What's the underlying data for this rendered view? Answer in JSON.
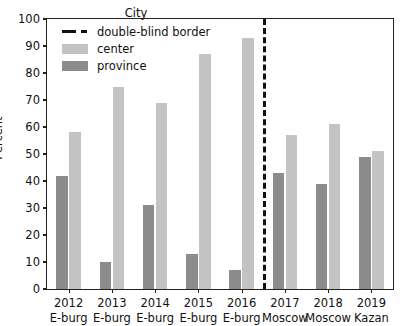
{
  "chart_data": {
    "type": "bar",
    "title": "",
    "xlabel": "",
    "ylabel": "Percent",
    "ylim": [
      0,
      100
    ],
    "yticks": [
      0,
      10,
      20,
      30,
      40,
      50,
      60,
      70,
      80,
      90,
      100
    ],
    "grid": false,
    "legend": {
      "title": "City",
      "position": "upper-center",
      "entries": [
        {
          "label": "double-blind border",
          "style": "dashed-line",
          "color": "#111111"
        },
        {
          "label": "center",
          "style": "bar",
          "color": "#c3c3c3"
        },
        {
          "label": "province",
          "style": "bar",
          "color": "#8c8c8c"
        }
      ]
    },
    "categories": [
      {
        "year": "2012",
        "city": "E-burg"
      },
      {
        "year": "2013",
        "city": "E-burg"
      },
      {
        "year": "2014",
        "city": "E-burg"
      },
      {
        "year": "2015",
        "city": "E-burg"
      },
      {
        "year": "2016",
        "city": "E-burg"
      },
      {
        "year": "2017",
        "city": "Moscow"
      },
      {
        "year": "2018",
        "city": "Moscow"
      },
      {
        "year": "2019",
        "city": "Kazan"
      }
    ],
    "series": [
      {
        "name": "province",
        "color": "#8c8c8c",
        "values": [
          42,
          10,
          31,
          13,
          7,
          43,
          39,
          49
        ]
      },
      {
        "name": "center",
        "color": "#c3c3c3",
        "values": [
          58,
          75,
          69,
          87,
          93,
          57,
          61,
          51
        ]
      }
    ],
    "annotations": [
      {
        "type": "vline",
        "label": "double-blind border",
        "after_category_index": 4,
        "style": "dashed",
        "color": "#111111"
      }
    ]
  }
}
